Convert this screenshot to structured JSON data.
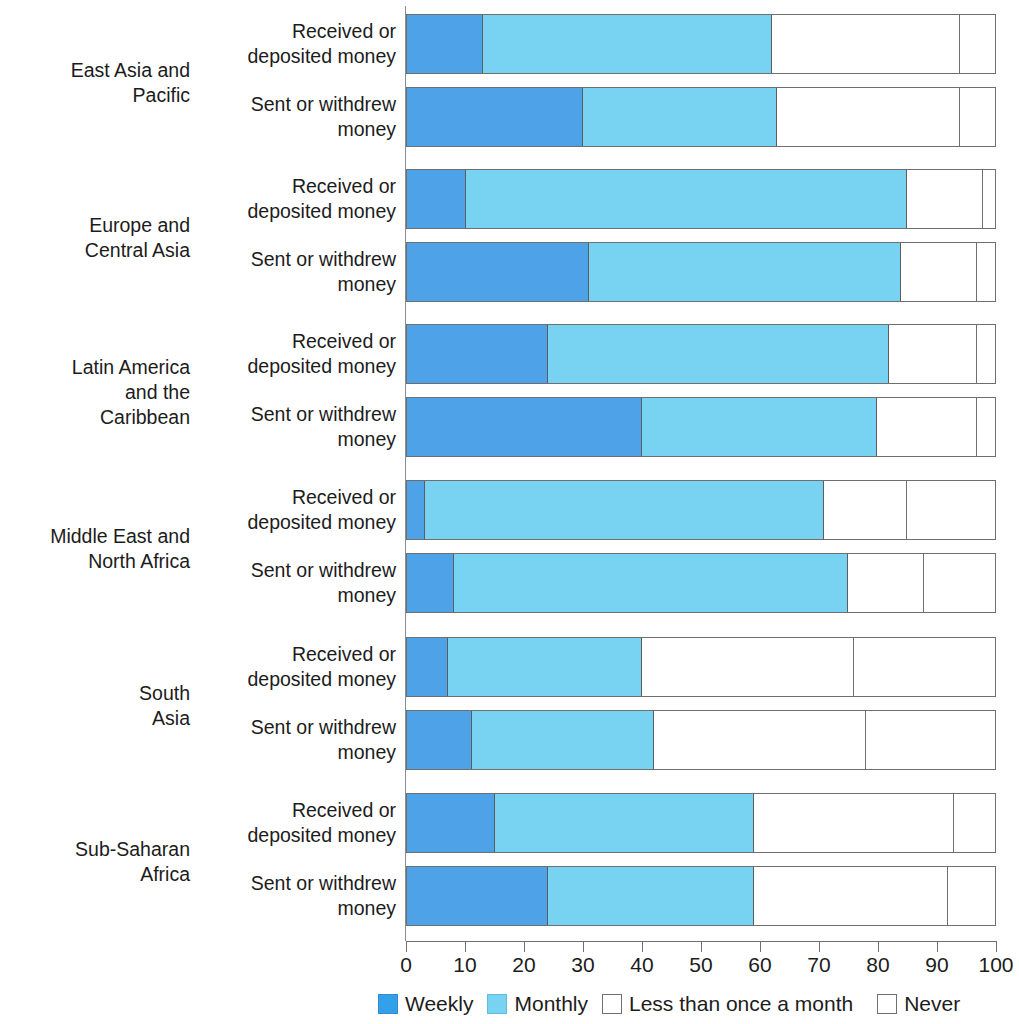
{
  "chart_data": {
    "type": "bar",
    "subtype": "horizontal-stacked-100",
    "title": "",
    "xlabel": "",
    "ylabel": "",
    "xlim": [
      0,
      100
    ],
    "grid": false,
    "legend_position": "bottom",
    "axis_ticks": [
      "0",
      "10",
      "20",
      "30",
      "40",
      "50",
      "60",
      "70",
      "80",
      "90",
      "100"
    ],
    "series": [
      {
        "name": "Weekly",
        "color": "#4da2e8"
      },
      {
        "name": "Monthly",
        "color": "#78d2f2"
      },
      {
        "name": "Less than once a month",
        "color": "#ffffff"
      },
      {
        "name": "Never",
        "color": "#ffffff"
      }
    ],
    "regions": [
      {
        "name": "East Asia and\nPacific",
        "rows": [
          {
            "label": "Received or\ndeposited money",
            "values": [
              13,
              49,
              32,
              6
            ]
          },
          {
            "label": "Sent or withdrew\nmoney",
            "values": [
              30,
              33,
              31,
              6
            ]
          }
        ]
      },
      {
        "name": "Europe and\nCentral Asia",
        "rows": [
          {
            "label": "Received or\ndeposited money",
            "values": [
              10,
              75,
              13,
              2
            ]
          },
          {
            "label": "Sent or withdrew\nmoney",
            "values": [
              31,
              53,
              13,
              3
            ]
          }
        ]
      },
      {
        "name": "Latin America\nand the\nCaribbean",
        "rows": [
          {
            "label": "Received or\ndeposited money",
            "values": [
              24,
              58,
              15,
              3
            ]
          },
          {
            "label": "Sent or withdrew\nmoney",
            "values": [
              40,
              40,
              17,
              3
            ]
          }
        ]
      },
      {
        "name": "Middle East and\nNorth Africa",
        "rows": [
          {
            "label": "Received or\ndeposited money",
            "values": [
              3,
              68,
              14,
              15
            ]
          },
          {
            "label": "Sent or withdrew\nmoney",
            "values": [
              8,
              67,
              13,
              12
            ]
          }
        ]
      },
      {
        "name": "South\nAsia",
        "rows": [
          {
            "label": "Received or\ndeposited money",
            "values": [
              7,
              33,
              36,
              24
            ]
          },
          {
            "label": "Sent or withdrew\nmoney",
            "values": [
              11,
              31,
              36,
              22
            ]
          }
        ]
      },
      {
        "name": "Sub-Saharan\nAfrica",
        "rows": [
          {
            "label": "Received or\ndeposited money",
            "values": [
              15,
              44,
              34,
              7
            ]
          },
          {
            "label": "Sent or withdrew\nmoney",
            "values": [
              24,
              35,
              33,
              8
            ]
          }
        ]
      }
    ]
  },
  "legend": {
    "items": [
      {
        "label": "Weekly",
        "key": "weekly"
      },
      {
        "label": "Monthly",
        "key": "monthly"
      },
      {
        "label": "Less than once a month",
        "key": "less"
      },
      {
        "label": "Never",
        "key": "never"
      }
    ]
  },
  "colors": {
    "weekly": "#4da2e8",
    "monthly": "#78d2f2",
    "less_than_once_a_month": "#ffffff",
    "never": "#ffffff",
    "outline": "#6f6f6f",
    "text": "#1c1c1c"
  }
}
